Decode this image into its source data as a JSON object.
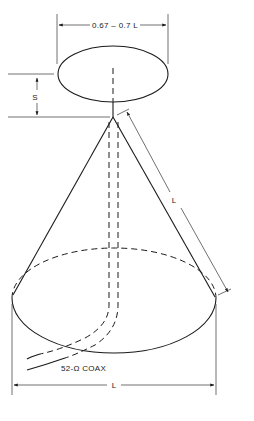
{
  "diagram": {
    "labels": {
      "disc_diameter": "0.67 – 0.7 L",
      "spacing": "S",
      "slant_length": "L",
      "base_diameter": "L",
      "feedline": "52-Ω COAX"
    },
    "parts": [
      "disc",
      "cone",
      "coax feedline",
      "apex feedpoint"
    ],
    "colors": {
      "line": "#1a1a1a",
      "background": "#ffffff"
    }
  }
}
